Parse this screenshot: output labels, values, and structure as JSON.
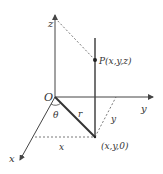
{
  "diagram": {
    "type": "cylindrical-coordinates",
    "labels": {
      "z_axis": "z",
      "y_axis": "y",
      "x_axis": "x",
      "origin": "O",
      "theta": "θ",
      "radius": "r",
      "point": "P(x,y,z)",
      "projection": "(x,y,0)",
      "x_length": "x",
      "y_length": "y"
    },
    "colors": {
      "axis": "#444444",
      "line": "#333333",
      "dashed": "#555555",
      "text": "#333333"
    }
  }
}
